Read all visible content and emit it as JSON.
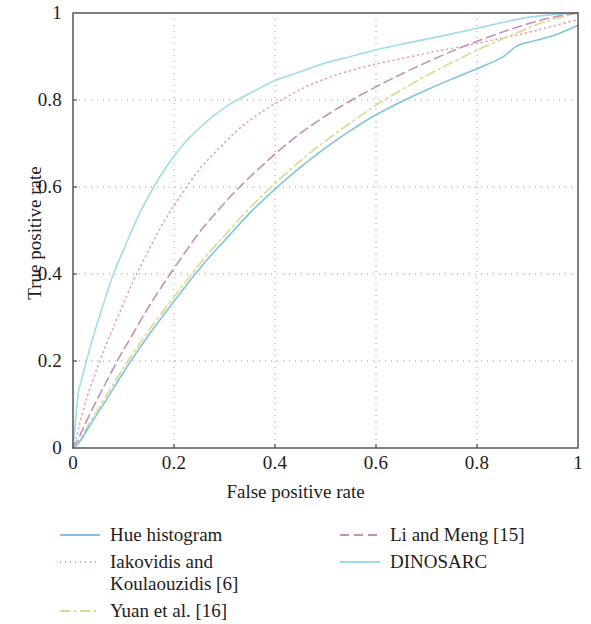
{
  "figure": {
    "type": "roc-curve-figure",
    "background": "#ffffff"
  },
  "axes": {
    "x_title": "False positive rate",
    "y_title": "True positive rate",
    "x_ticks": [
      "0",
      "0.2",
      "0.4",
      "0.6",
      "0.8",
      "1"
    ],
    "y_ticks": [
      "0",
      "0.2",
      "0.4",
      "0.6",
      "0.8",
      "1"
    ],
    "axis_color": "#4a4a4a",
    "grid_color": "#9a9a9a"
  },
  "legend": {
    "columns": [
      {
        "items": [
          {
            "label": "Hue histogram",
            "color": "#7fc4de",
            "style": "solid",
            "name": "hue-histogram"
          },
          {
            "label": "Iakovidis and\nKoulaouzidis [6]",
            "color": "#e8a0ae",
            "style": "dotted",
            "name": "iakovidis-koulaouzidis"
          },
          {
            "label": "Yuan et al. [16]",
            "color": "#d7dc8c",
            "style": "dashdot",
            "name": "yuan-et-al"
          }
        ]
      },
      {
        "items": [
          {
            "label": "Li and Meng [15]",
            "color": "#c58fc0",
            "style": "dashed",
            "name": "li-and-meng"
          },
          {
            "label": "DINOSARC",
            "color": "#9fdcee",
            "style": "solid",
            "name": "dinosarc"
          }
        ]
      }
    ]
  },
  "chart_data": {
    "type": "line",
    "title": "",
    "xlabel": "False positive rate",
    "ylabel": "True positive rate",
    "xlim": [
      0,
      1
    ],
    "ylim": [
      0,
      1
    ],
    "grid": true,
    "legend_position": "below",
    "series": [
      {
        "name": "DINOSARC",
        "color": "#9fdcee",
        "style": "solid",
        "x": [
          0,
          0.004,
          0.008,
          0.012,
          0.02,
          0.03,
          0.045,
          0.06,
          0.08,
          0.1,
          0.13,
          0.16,
          0.19,
          0.22,
          0.25,
          0.28,
          0.31,
          0.35,
          0.4,
          0.45,
          0.5,
          0.55,
          0.6,
          0.65,
          0.7,
          0.75,
          0.8,
          0.85,
          0.9,
          0.95,
          1.0
        ],
        "y": [
          0,
          0.05,
          0.1,
          0.135,
          0.17,
          0.215,
          0.275,
          0.33,
          0.4,
          0.455,
          0.535,
          0.6,
          0.655,
          0.7,
          0.735,
          0.765,
          0.79,
          0.815,
          0.845,
          0.865,
          0.885,
          0.9,
          0.915,
          0.928,
          0.94,
          0.952,
          0.965,
          0.978,
          0.99,
          0.996,
          1.0
        ]
      },
      {
        "name": "Iakovidis and Koulaouzidis [6]",
        "color": "#e8a0ae",
        "style": "dotted",
        "x": [
          0,
          0.006,
          0.012,
          0.02,
          0.03,
          0.05,
          0.07,
          0.09,
          0.12,
          0.15,
          0.18,
          0.21,
          0.25,
          0.29,
          0.33,
          0.37,
          0.42,
          0.47,
          0.52,
          0.57,
          0.62,
          0.67,
          0.72,
          0.78,
          0.84,
          0.9,
          0.95,
          1.0
        ],
        "y": [
          0,
          0.02,
          0.05,
          0.085,
          0.125,
          0.19,
          0.25,
          0.305,
          0.385,
          0.455,
          0.52,
          0.575,
          0.64,
          0.69,
          0.735,
          0.77,
          0.805,
          0.835,
          0.857,
          0.874,
          0.888,
          0.9,
          0.912,
          0.925,
          0.94,
          0.955,
          0.97,
          0.985
        ]
      },
      {
        "name": "Li and Meng [15]",
        "color": "#c58fc0",
        "style": "dashed",
        "x": [
          0,
          0.008,
          0.018,
          0.03,
          0.045,
          0.065,
          0.09,
          0.115,
          0.145,
          0.175,
          0.21,
          0.25,
          0.29,
          0.33,
          0.38,
          0.43,
          0.48,
          0.53,
          0.58,
          0.63,
          0.68,
          0.73,
          0.78,
          0.84,
          0.9,
          0.95,
          1.0
        ],
        "y": [
          0,
          0.015,
          0.04,
          0.07,
          0.105,
          0.15,
          0.205,
          0.255,
          0.315,
          0.37,
          0.43,
          0.495,
          0.55,
          0.6,
          0.655,
          0.705,
          0.748,
          0.785,
          0.818,
          0.848,
          0.876,
          0.902,
          0.926,
          0.952,
          0.975,
          0.99,
          1.0
        ]
      },
      {
        "name": "Yuan et al. [16]",
        "color": "#d7dc8c",
        "style": "dashdot",
        "x": [
          0,
          0.01,
          0.022,
          0.035,
          0.05,
          0.07,
          0.095,
          0.125,
          0.155,
          0.19,
          0.225,
          0.265,
          0.305,
          0.35,
          0.4,
          0.45,
          0.5,
          0.55,
          0.6,
          0.65,
          0.7,
          0.75,
          0.81,
          0.87,
          0.93,
          1.0
        ],
        "y": [
          0,
          0.012,
          0.035,
          0.062,
          0.09,
          0.128,
          0.175,
          0.228,
          0.278,
          0.332,
          0.385,
          0.443,
          0.495,
          0.552,
          0.608,
          0.66,
          0.706,
          0.748,
          0.788,
          0.823,
          0.856,
          0.886,
          0.92,
          0.95,
          0.978,
          1.0
        ]
      },
      {
        "name": "Hue histogram",
        "color": "#7fc4de",
        "style": "solid",
        "x": [
          0,
          0.01,
          0.022,
          0.035,
          0.05,
          0.07,
          0.095,
          0.125,
          0.155,
          0.19,
          0.225,
          0.265,
          0.305,
          0.35,
          0.4,
          0.45,
          0.5,
          0.55,
          0.6,
          0.65,
          0.7,
          0.75,
          0.8,
          0.85,
          0.88,
          0.92,
          0.96,
          1.0
        ],
        "y": [
          0,
          0.01,
          0.03,
          0.055,
          0.082,
          0.118,
          0.165,
          0.218,
          0.268,
          0.322,
          0.375,
          0.432,
          0.483,
          0.54,
          0.595,
          0.645,
          0.69,
          0.73,
          0.766,
          0.796,
          0.823,
          0.848,
          0.872,
          0.898,
          0.925,
          0.938,
          0.952,
          0.972
        ]
      }
    ]
  }
}
